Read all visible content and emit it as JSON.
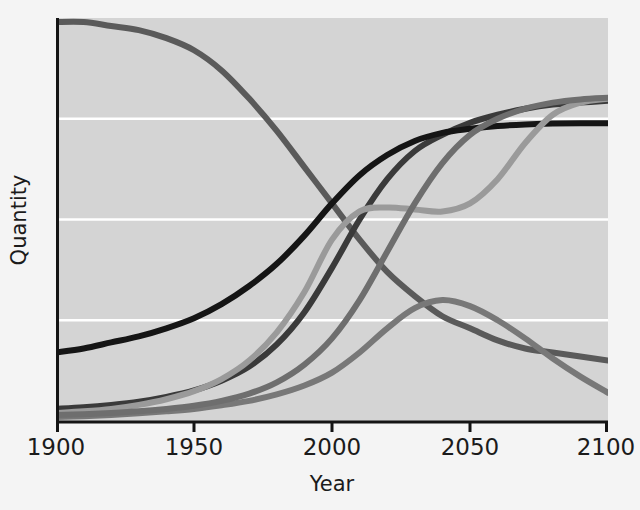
{
  "chart_data": {
    "type": "line",
    "title": "",
    "xlabel": "Year",
    "ylabel": "Quantity",
    "xlim": [
      1900,
      2100
    ],
    "ylim": [
      0,
      100
    ],
    "grid": true,
    "grid_orientation": "horizontal",
    "gridlines_y": [
      25,
      50,
      75
    ],
    "legend": "none",
    "xticks": [
      1900,
      1950,
      2000,
      2050,
      2100
    ],
    "xtick_labels": [
      "1900",
      "1950",
      "2000",
      "2050",
      "2100"
    ],
    "ytick_labels": [],
    "plot_background": "#d4d4d4",
    "gridline_color": "#ffffff",
    "axis_color": "#141414",
    "x": [
      1900,
      1910,
      1920,
      1930,
      1940,
      1950,
      1960,
      1970,
      1980,
      1990,
      2000,
      2010,
      2020,
      2030,
      2040,
      2050,
      2060,
      2070,
      2080,
      2090,
      2100
    ],
    "series": [
      {
        "name": "declining-curve",
        "color": "#5a5a5a",
        "width": 6,
        "values": [
          99,
          99,
          98,
          97,
          95,
          92,
          87,
          80,
          72,
          63,
          54,
          45,
          37,
          31,
          26,
          23,
          20,
          18,
          17,
          16,
          15
        ]
      },
      {
        "name": "rising-dark-curve",
        "color": "#3a3a3a",
        "width": 6,
        "values": [
          3,
          3.4,
          4,
          4.8,
          6,
          7.6,
          10,
          13.5,
          19,
          27,
          38,
          50,
          60,
          67,
          71,
          74,
          76,
          77.5,
          78.5,
          79,
          79.5
        ]
      },
      {
        "name": "rising-black-curve",
        "color": "#151515",
        "width": 6,
        "values": [
          17,
          18,
          19.5,
          21,
          23,
          25.5,
          29,
          33.5,
          39,
          46,
          54,
          61,
          66,
          69.5,
          71.5,
          72.5,
          73.2,
          73.6,
          73.8,
          73.9,
          73.9
        ]
      },
      {
        "name": "plateau-rising-light-curve",
        "color": "#9a9a9a",
        "width": 6,
        "values": [
          2,
          2.4,
          3,
          4,
          5.4,
          7.4,
          10.4,
          15,
          22,
          32,
          45,
          52,
          53,
          52.5,
          52,
          54,
          60,
          69,
          76,
          79,
          80
        ]
      },
      {
        "name": "hump-curve",
        "color": "#787878",
        "width": 6,
        "values": [
          1,
          1.2,
          1.5,
          1.9,
          2.4,
          3,
          3.9,
          5,
          6.6,
          8.8,
          12,
          17,
          23,
          28,
          30,
          28.5,
          25,
          20.5,
          15.5,
          11,
          7
        ]
      },
      {
        "name": "low-rising-gray-curve",
        "color": "#6e6e6e",
        "width": 6,
        "values": [
          1.5,
          1.7,
          2,
          2.4,
          3,
          3.8,
          5,
          6.8,
          9.6,
          14,
          20.5,
          30,
          42,
          54,
          64,
          71,
          75,
          77.5,
          79,
          79.8,
          80.2
        ]
      }
    ]
  }
}
